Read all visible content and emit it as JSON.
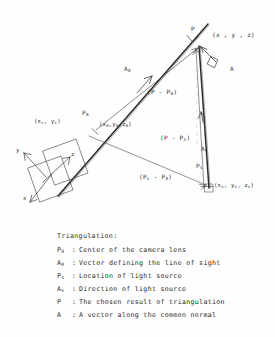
{
  "figure": {
    "kind": "triangulation-geometry-diagram",
    "legend_title": "Triangulation:",
    "legend": [
      {
        "symbol": "P",
        "sub": "0",
        "sep": ":",
        "description": "Center of the camera lens"
      },
      {
        "symbol": "A",
        "sub": "0",
        "sep": ":",
        "description": "Vector defining the line of sight"
      },
      {
        "symbol": "P",
        "sub": "s",
        "sep": ":",
        "description": "Location of light source"
      },
      {
        "symbol": "A",
        "sub": "s",
        "sep": ":",
        "description": "Direction of light source"
      },
      {
        "symbol": "P",
        "sub": "",
        "sep": ":",
        "description": "The chosen result of triangulation"
      },
      {
        "symbol": "A",
        "sub": "",
        "sep": ":",
        "description": "A vector along the common normal"
      }
    ],
    "labels": {
      "p_point": "P",
      "p_coords": "(x , y , z)",
      "a_vector": "A",
      "a0_vector": "A",
      "a0_sub": "0",
      "as_vector": "A",
      "as_sub": "s",
      "p0_point": "P",
      "p0_sub": "0",
      "p0_coords": "(x , y , z )",
      "p0_coords_sub": "0",
      "ps_point": "P",
      "ps_sub": "s",
      "ps_coords": "(x , y , z )",
      "ps_coords_sub": "s",
      "camera_coords": "(x , y )",
      "camera_coords_sub": "c",
      "vec_p_minus_p0": "(P - P )",
      "vec_p_minus_p0_sub": "0",
      "vec_p_minus_ps": "(P - P )",
      "vec_p_minus_ps_sub": "s",
      "vec_ps_minus_p0": "(P  - P )",
      "axis_x": "x",
      "axis_y": "y",
      "axis_z": "z"
    },
    "colors": {
      "ink": "#2b2b2b",
      "ink_light": "#555555",
      "paper": "#fefefe"
    }
  }
}
